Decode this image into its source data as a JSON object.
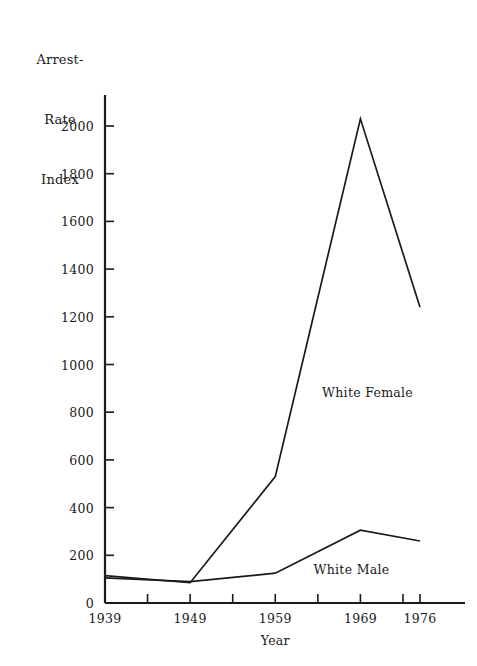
{
  "chart_data": {
    "type": "line",
    "title": "",
    "ylabel": "Arrest-\nRate\nIndex",
    "ylabel_lines": [
      "Arrest-",
      "Rate",
      "Index"
    ],
    "xlabel": "Year",
    "x": [
      1939,
      1949,
      1959,
      1969,
      1976
    ],
    "categories": [
      "1939",
      "1949",
      "1959",
      "1969",
      "1976"
    ],
    "xtick_labels": [
      "1939",
      "1949",
      "1959",
      "1969",
      "1976"
    ],
    "ytick_labels": [
      "0",
      "200",
      "400",
      "600",
      "800",
      "1000",
      "1200",
      "1400",
      "1600",
      "1800",
      "2000"
    ],
    "ytick_values": [
      0,
      200,
      400,
      600,
      800,
      1000,
      1200,
      1400,
      1600,
      1800,
      2000
    ],
    "ylim": [
      0,
      2180
    ],
    "xlim": [
      1939,
      1978
    ],
    "grid": false,
    "legend_position": "inline-annotation",
    "series": [
      {
        "name": "White Female",
        "label": "White Female",
        "values": [
          115,
          85,
          530,
          2030,
          1240
        ],
        "color": "#1a1a1a"
      },
      {
        "name": "White Male",
        "label": "White Male",
        "values": [
          105,
          90,
          125,
          305,
          260
        ],
        "color": "#1a1a1a"
      }
    ],
    "annotations": [
      {
        "text": "White Female",
        "x": 1964.5,
        "y": 880
      },
      {
        "text": "White Male",
        "x": 1963.5,
        "y": 140
      }
    ],
    "axis_color": "#1a1a1a",
    "background_color": "#ffffff"
  }
}
